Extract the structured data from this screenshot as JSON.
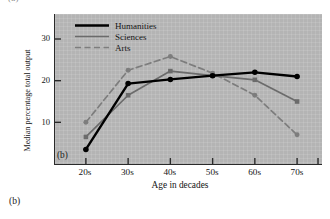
{
  "figure": {
    "panel_label_top": "(a)",
    "panel_label_bottom": "(b)",
    "panel_tag_inner": "(b)"
  },
  "colors": {
    "plot_background": "#b4b4b4",
    "axis": "#2a2a2a",
    "humanities": "#000000",
    "sciences": "#6b6b6b",
    "arts": "#7d7d7d",
    "text": "#141414"
  },
  "chart_data": {
    "type": "line",
    "title": "",
    "xlabel": "Age in decades",
    "ylabel": "Median percentage total output",
    "categories": [
      "20s",
      "30s",
      "40s",
      "50s",
      "60s",
      "70s"
    ],
    "x_tick_labels": [
      "20s",
      "30s",
      "40s",
      "50s",
      "60s",
      "70s"
    ],
    "y_tick_labels": [
      "10",
      "20",
      "30"
    ],
    "y_ticks": [
      10,
      20,
      30
    ],
    "ylim": [
      0,
      36
    ],
    "xlim": [
      0,
      7
    ],
    "grid": true,
    "legend_position": "top-left-inside",
    "series": [
      {
        "name": "Humanities",
        "style": "solid-thick",
        "color": "#000000",
        "marker": "circle",
        "values": [
          3.5,
          19.3,
          20.3,
          21.2,
          22.0,
          21.0
        ]
      },
      {
        "name": "Sciences",
        "style": "solid-thin",
        "color": "#6b6b6b",
        "marker": "square",
        "values": [
          6.5,
          16.5,
          22.3,
          21.2,
          20.2,
          15.0
        ]
      },
      {
        "name": "Arts",
        "style": "dashed",
        "color": "#7d7d7d",
        "marker": "circle",
        "values": [
          10.0,
          22.5,
          25.8,
          21.8,
          16.5,
          7.0
        ]
      }
    ]
  }
}
